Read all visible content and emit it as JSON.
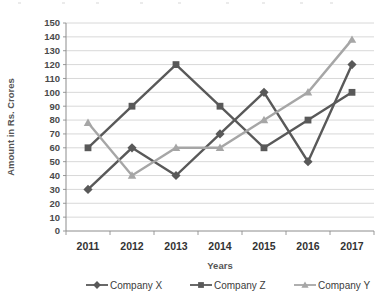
{
  "chart_data": {
    "type": "line",
    "title": "",
    "subtitle": "",
    "xlabel": "Years",
    "ylabel": "Amount in Rs. Crores",
    "categories": [
      "2011",
      "2012",
      "2013",
      "2014",
      "2015",
      "2016",
      "2017"
    ],
    "x": [
      2011,
      2012,
      2013,
      2014,
      2015,
      2016,
      2017
    ],
    "ylim": [
      0,
      150
    ],
    "ytick_step": 10,
    "yticks": [
      0,
      10,
      20,
      30,
      40,
      50,
      60,
      70,
      80,
      90,
      100,
      110,
      120,
      130,
      140,
      150
    ],
    "ytick_labels": [
      "0",
      "10",
      "20",
      "30",
      "40",
      "50",
      "60",
      "70",
      "80",
      "90",
      "100",
      "110",
      "120",
      "130",
      "140",
      "150"
    ],
    "grid": true,
    "grid_axis": "y",
    "legend_position": "bottom",
    "series": [
      {
        "name": "Company X",
        "marker": "diamond",
        "color": "#595959",
        "values": [
          30,
          60,
          40,
          70,
          100,
          50,
          120
        ]
      },
      {
        "name": "Company Z",
        "marker": "square",
        "color": "#595959",
        "values": [
          60,
          90,
          120,
          90,
          60,
          80,
          100
        ]
      },
      {
        "name": "Company Y",
        "marker": "triangle",
        "color": "#a6a6a6",
        "values": [
          78,
          40,
          60,
          60,
          80,
          100,
          138
        ]
      }
    ]
  },
  "legend": {
    "items": [
      {
        "label": "Company X",
        "marker": "diamond-marker-icon",
        "color": "#595959"
      },
      {
        "label": "Company Z",
        "marker": "square-marker-icon",
        "color": "#595959"
      },
      {
        "label": "Company Y",
        "marker": "triangle-marker-icon",
        "color": "#a6a6a6"
      }
    ]
  },
  "axes": {
    "x_title": "Years",
    "y_title": "Amount in Rs. Crores"
  },
  "colors": {
    "company_x": "#595959",
    "company_z": "#595959",
    "company_y": "#a6a6a6",
    "grid": "#d8d8d8",
    "axis": "#8c8c8c",
    "background": "#ffffff"
  }
}
